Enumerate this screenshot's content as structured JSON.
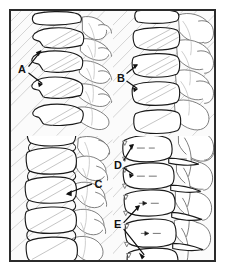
{
  "figure": {
    "panel_count": 4,
    "border_color": "#2b2b2b",
    "ink_color": "#1a1a1a",
    "background_color": "#ffffff",
    "panel_background": "#fbfbfb",
    "shading_color": "#c3c3c3"
  },
  "panels": [
    {
      "id": "panel-a",
      "position": "top-left",
      "region": "cervical spine, lateral",
      "label": "A",
      "label_x": 22,
      "label_y": 58,
      "callout_count": 2,
      "vertebra_count": 5
    },
    {
      "id": "panel-b",
      "position": "top-right",
      "region": "cervical spine, lateral",
      "label": "B",
      "label_x": 14,
      "label_y": 78,
      "callout_count": 2,
      "vertebra_count": 4
    },
    {
      "id": "panel-c",
      "position": "bottom-left",
      "region": "lumbar spine, lateral",
      "label": "C",
      "label_x": 84,
      "label_y": 50,
      "callout_count": 1,
      "vertebra_count": 5
    },
    {
      "id": "panel-d",
      "position": "bottom-right",
      "region": "lumbar spine, lateral",
      "label": "D",
      "label_x": 8,
      "label_y": 30,
      "callout_count": 2,
      "vertebra_count": 4
    },
    {
      "id": "panel-e",
      "position": "bottom-right",
      "region": "lumbar spine, lateral",
      "label": "E",
      "label_x": 8,
      "label_y": 90,
      "callout_count": 2,
      "vertebra_count": 4
    }
  ],
  "labels": {
    "a": "A",
    "b": "B",
    "c": "C",
    "d": "D",
    "e": "E"
  }
}
